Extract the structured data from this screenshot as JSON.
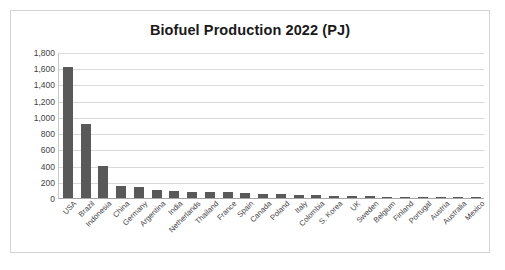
{
  "chart_data": {
    "type": "bar",
    "title": "Biofuel Production 2022 (PJ)",
    "xlabel": "",
    "ylabel": "",
    "ylim": [
      0,
      1800
    ],
    "ytick_step": 200,
    "yticks": [
      "0",
      "200",
      "400",
      "600",
      "800",
      "1,000",
      "1,200",
      "1,400",
      "1,600",
      "1,800"
    ],
    "grid": "horizontal",
    "legend": "none",
    "bar_color": "#595959",
    "categories": [
      "USA",
      "Brazil",
      "Indonesia",
      "China",
      "Germany",
      "Argentina",
      "India",
      "Netherlands",
      "Thailand",
      "France",
      "Spain",
      "Canada",
      "Poland",
      "Italy",
      "Colombia",
      "S. Korea",
      "UK",
      "Sweden",
      "Belgium",
      "Finland",
      "Portugal",
      "Austria",
      "Australia",
      "Mexico"
    ],
    "values": [
      1620,
      910,
      390,
      150,
      135,
      95,
      90,
      80,
      75,
      72,
      68,
      48,
      45,
      40,
      35,
      28,
      22,
      20,
      18,
      15,
      12,
      10,
      8,
      6
    ]
  },
  "axis": {
    "y_min_label": "0",
    "y_max_label": "1,800"
  }
}
